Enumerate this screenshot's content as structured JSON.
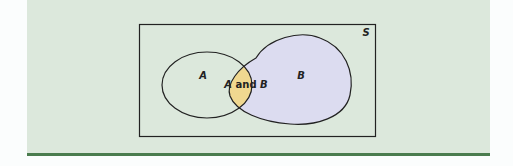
{
  "diagram": {
    "type": "venn",
    "universe_label": "S",
    "sets": [
      {
        "id": "A",
        "label": "A",
        "fill": "none"
      },
      {
        "id": "B",
        "label": "B",
        "fill": "#dcdcf0"
      }
    ],
    "intersection": {
      "label_prefix": "A",
      "label_connector": " and ",
      "label_suffix": "B",
      "fill": "#f0d890"
    }
  },
  "colors": {
    "panel_background": "#dce8dc",
    "bottom_rule": "#4a7c4e",
    "outline": "#222222"
  }
}
